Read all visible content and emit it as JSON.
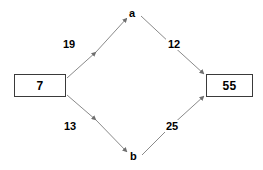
{
  "diagram": {
    "type": "directed-weighted-graph",
    "shape": "diamond",
    "background_color": "#ffffff",
    "line_color": "#808080",
    "text_color": "#000000",
    "box_border_color": "#3a3a3a",
    "nodes": {
      "source": {
        "label": "7",
        "style": "box",
        "position": "left"
      },
      "top": {
        "label": "a",
        "style": "plain-text",
        "position": "top"
      },
      "bottom": {
        "label": "b",
        "style": "plain-text",
        "position": "bottom"
      },
      "sink": {
        "label": "55",
        "style": "box",
        "position": "right"
      }
    },
    "edges": [
      {
        "from": "7",
        "to": "a",
        "weight": "19",
        "direction": "up-right"
      },
      {
        "from": "a",
        "to": "55",
        "weight": "12",
        "direction": "down-right"
      },
      {
        "from": "7",
        "to": "b",
        "weight": "13",
        "direction": "down-right"
      },
      {
        "from": "b",
        "to": "55",
        "weight": "25",
        "direction": "up-right"
      }
    ]
  }
}
